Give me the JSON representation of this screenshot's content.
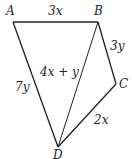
{
  "diagram": {
    "type": "quadrilateral-with-diagonal",
    "vertices": {
      "A": {
        "label": "A",
        "x": 13,
        "y": 22
      },
      "B": {
        "label": "B",
        "x": 98,
        "y": 22
      },
      "C": {
        "label": "C",
        "x": 116,
        "y": 84
      },
      "D": {
        "label": "D",
        "x": 58,
        "y": 147
      }
    },
    "edges": {
      "AB": {
        "label": "3x"
      },
      "BC": {
        "label": "3y"
      },
      "CD": {
        "label": "2x"
      },
      "AD": {
        "label": "7y"
      },
      "BD": {
        "label": "4x + y"
      }
    },
    "colors": {
      "stroke": "#231f20",
      "background": "#ffffff"
    }
  }
}
